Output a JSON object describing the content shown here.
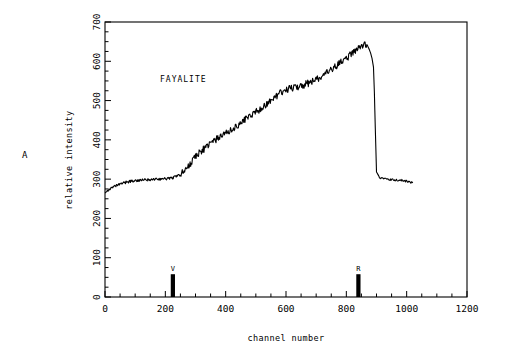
{
  "panel": {
    "label": "A"
  },
  "chart_data": {
    "type": "line",
    "title": "",
    "annotation": "FAYALITE",
    "xlabel": "channel number",
    "ylabel": "relative intensity",
    "xlim": [
      0,
      1200
    ],
    "ylim": [
      0,
      700
    ],
    "xticks": [
      0,
      200,
      400,
      600,
      800,
      1000,
      1200
    ],
    "yticks": [
      0,
      100,
      200,
      300,
      400,
      500,
      600,
      700
    ],
    "xtick_labels": [
      "0",
      "200",
      "400",
      "600",
      "800",
      "1000",
      "1200"
    ],
    "ytick_labels": [
      "0",
      "100",
      "200",
      "300",
      "400",
      "500",
      "600",
      "700"
    ],
    "minor_tick_interval_x": 50,
    "minor_tick_interval_y": 25,
    "grid": false,
    "legend": "none",
    "line_color": "#000000",
    "series": [
      {
        "name": "fayalite spectrum",
        "x": [
          0,
          10,
          20,
          30,
          40,
          50,
          60,
          70,
          80,
          90,
          100,
          110,
          120,
          130,
          140,
          150,
          160,
          170,
          180,
          190,
          200,
          210,
          220,
          230,
          240,
          250,
          260,
          270,
          280,
          290,
          300,
          310,
          320,
          330,
          340,
          350,
          360,
          370,
          380,
          390,
          400,
          410,
          420,
          430,
          440,
          450,
          460,
          470,
          480,
          490,
          500,
          510,
          520,
          530,
          540,
          550,
          560,
          570,
          580,
          590,
          600,
          610,
          620,
          630,
          640,
          650,
          660,
          670,
          680,
          690,
          700,
          710,
          720,
          730,
          740,
          750,
          760,
          770,
          780,
          790,
          800,
          810,
          820,
          830,
          840,
          850,
          860,
          870,
          875,
          880,
          885,
          890,
          893,
          896,
          900,
          910,
          920,
          930,
          940,
          950,
          960,
          970,
          980,
          990,
          1000,
          1010,
          1020
        ],
        "y": [
          268,
          272,
          276,
          280,
          284,
          287,
          290,
          292,
          294,
          295,
          296,
          297,
          297,
          298,
          298,
          299,
          299,
          300,
          300,
          301,
          301,
          302,
          303,
          305,
          308,
          312,
          318,
          326,
          336,
          348,
          358,
          366,
          372,
          378,
          384,
          390,
          396,
          402,
          408,
          412,
          416,
          421,
          426,
          431,
          437,
          443,
          450,
          456,
          462,
          467,
          471,
          476,
          482,
          488,
          494,
          500,
          506,
          512,
          518,
          524,
          528,
          530,
          532,
          534,
          536,
          538,
          540,
          543,
          546,
          550,
          554,
          558,
          562,
          567,
          572,
          578,
          584,
          590,
          596,
          602,
          608,
          614,
          620,
          626,
          632,
          638,
          645,
          640,
          632,
          622,
          608,
          585,
          520,
          430,
          318,
          305,
          302,
          300,
          299,
          298,
          298,
          297,
          297,
          296,
          295,
          293,
          290
        ],
        "noise_amplitude": 9
      }
    ],
    "markers": [
      {
        "label": "V",
        "channel": 225,
        "height": 58,
        "width_channels": 14
      },
      {
        "label": "R",
        "channel": 840,
        "height": 58,
        "width_channels": 14
      }
    ]
  }
}
